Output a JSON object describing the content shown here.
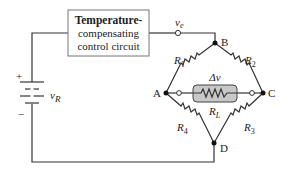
{
  "diagram": {
    "control_box": {
      "line1": "Temperature-",
      "line2": "compensating",
      "line3": "control circuit"
    },
    "source": {
      "label_main": "v",
      "label_sub": "R",
      "plus": "+",
      "minus": "−"
    },
    "output_terminal": {
      "label_main": "v",
      "label_sub": "e"
    },
    "nodes": {
      "A": "A",
      "B": "B",
      "C": "C",
      "D": "D"
    },
    "resistors": {
      "R1": {
        "main": "R",
        "sub": "1"
      },
      "R2": {
        "main": "R",
        "sub": "2"
      },
      "R3": {
        "main": "R",
        "sub": "3"
      },
      "R4": {
        "main": "R",
        "sub": "4"
      },
      "RL": {
        "main": "R",
        "sub": "L"
      }
    },
    "delta_v": "Δv",
    "colors": {
      "wire": "#333333",
      "box_border": "#777777",
      "load_fill": "#c8c8c8",
      "text": "#222222"
    }
  }
}
